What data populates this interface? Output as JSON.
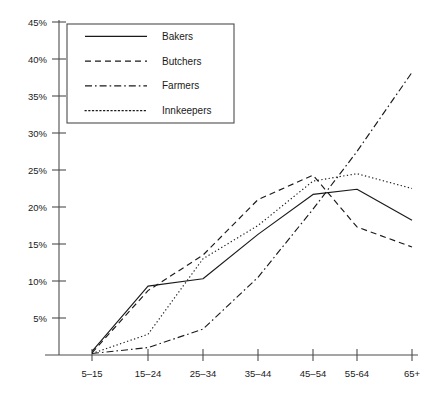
{
  "chart_data": {
    "type": "line",
    "title": "",
    "subtitle": "",
    "xlabel": "",
    "ylabel": "",
    "categories": [
      "5–15",
      "15–24",
      "25–34",
      "35–44",
      "45–54",
      "55-64",
      "65+"
    ],
    "ytick_labels": [
      "5%",
      "10%",
      "15%",
      "20%",
      "25%",
      "30%",
      "35%",
      "40%",
      "45%"
    ],
    "ytick_values": [
      5,
      10,
      15,
      20,
      25,
      30,
      35,
      40,
      45
    ],
    "ylim": [
      0,
      45
    ],
    "grid": false,
    "legend_position": "top-left",
    "series": [
      {
        "name": "Bakers",
        "style": "solid",
        "values": [
          0.5,
          9.3,
          10.3,
          16.3,
          21.7,
          22.4,
          18.2
        ]
      },
      {
        "name": "Butchers",
        "style": "dashed",
        "values": [
          0.3,
          8.7,
          13.5,
          21.0,
          24.3,
          17.3,
          14.6
        ]
      },
      {
        "name": "Farmers",
        "style": "dashdot",
        "values": [
          0.2,
          1.0,
          3.5,
          10.5,
          19.7,
          27.5,
          38.2
        ]
      },
      {
        "name": "Innkeepers",
        "style": "dotted",
        "values": [
          0.2,
          2.8,
          13.0,
          17.5,
          23.5,
          24.5,
          22.5
        ]
      }
    ]
  },
  "legend": {
    "entries": [
      {
        "label": "Bakers"
      },
      {
        "label": "Butchers"
      },
      {
        "label": "Farmers"
      },
      {
        "label": "Innkeepers"
      }
    ]
  },
  "colors": {
    "line": "#1a1a1a",
    "axis": "#4d4d4d",
    "background": "#ffffff"
  }
}
